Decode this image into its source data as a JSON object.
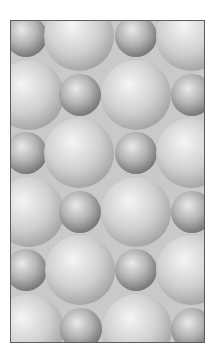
{
  "image": {
    "description": "Grayscale illustration of a close-packed lattice of shaded spheres in alternating large and small sizes, inside a thin dark-gray rectangular frame",
    "frame": {
      "x": 10,
      "y": 20,
      "width": 194,
      "height": 322,
      "border_color": "#5e5e5e",
      "background_color": "#c9c9c9"
    },
    "page_background": "#ffffff",
    "colors": {
      "small_sphere_highlight": "#eaeaea",
      "small_sphere_mid": "#b4b4b4",
      "small_sphere_edge": "#787878",
      "large_sphere_highlight": "#f5f5f5",
      "large_sphere_mid": "#d0d0d0",
      "large_sphere_edge": "#a4a4a4"
    },
    "sphere_sizes": {
      "small_radius": 21,
      "large_radius": 35
    },
    "rows": [
      {
        "cy": 35,
        "spheres": [
          {
            "cx": 25,
            "size": "small"
          },
          {
            "cx": 78,
            "size": "large"
          },
          {
            "cx": 135,
            "size": "small"
          },
          {
            "cx": 190,
            "size": "large"
          }
        ]
      },
      {
        "cy": 94,
        "spheres": [
          {
            "cx": 28,
            "size": "large"
          },
          {
            "cx": 79,
            "size": "small"
          },
          {
            "cx": 135,
            "size": "large"
          },
          {
            "cx": 191,
            "size": "small"
          }
        ]
      },
      {
        "cy": 152,
        "spheres": [
          {
            "cx": 25,
            "size": "small"
          },
          {
            "cx": 78,
            "size": "large"
          },
          {
            "cx": 135,
            "size": "small"
          },
          {
            "cx": 190,
            "size": "large"
          }
        ]
      },
      {
        "cy": 211,
        "spheres": [
          {
            "cx": 28,
            "size": "large"
          },
          {
            "cx": 79,
            "size": "small"
          },
          {
            "cx": 135,
            "size": "large"
          },
          {
            "cx": 191,
            "size": "small"
          }
        ]
      },
      {
        "cy": 269,
        "spheres": [
          {
            "cx": 25,
            "size": "small"
          },
          {
            "cx": 79,
            "size": "large"
          },
          {
            "cx": 135,
            "size": "small"
          },
          {
            "cx": 190,
            "size": "large"
          }
        ]
      },
      {
        "cy": 328,
        "spheres": [
          {
            "cx": 28,
            "size": "large"
          },
          {
            "cx": 80,
            "size": "small"
          },
          {
            "cx": 136,
            "size": "large"
          },
          {
            "cx": 191,
            "size": "small"
          }
        ]
      }
    ]
  }
}
